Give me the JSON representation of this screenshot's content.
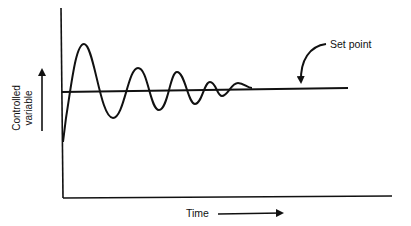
{
  "diagram": {
    "type": "damped-oscillation-response",
    "colors": {
      "background": "#ffffff",
      "ink": "#111111"
    },
    "labels": {
      "y_axis_line1": "Controlled",
      "y_axis_line2": "variable",
      "x_axis": "Time",
      "set_point": "Set point"
    },
    "icons": {
      "y_arrow": "arrow-up-icon",
      "x_arrow": "arrow-right-icon",
      "set_point_pointer": "curved-arrow-icon"
    }
  }
}
